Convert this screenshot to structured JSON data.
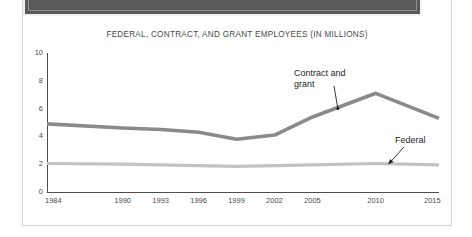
{
  "banner": {
    "name": "top-dark-banner",
    "color": "#5a5a5a"
  },
  "chart_data": {
    "type": "line",
    "title": "FEDERAL, CONTRACT, AND GRANT EMPLOYEES (IN MILLIONS)",
    "xlabel": "",
    "ylabel": "",
    "grid": false,
    "legend_position": "inline-annotation",
    "x": [
      1984,
      1990,
      1993,
      1996,
      1999,
      2002,
      2005,
      2010,
      2015
    ],
    "categories": [
      "1984",
      "1990",
      "1993",
      "1996",
      "1999",
      "2002",
      "2005",
      "2010",
      "2015"
    ],
    "xlim": [
      1984,
      2015
    ],
    "ylim": [
      0,
      10
    ],
    "yticks": [
      0,
      2,
      4,
      6,
      8,
      10
    ],
    "ytick_labels": [
      "0",
      "2",
      "4",
      "6",
      "8",
      "10"
    ],
    "series": [
      {
        "name": "Contract and grant",
        "label": "Contract and grant",
        "color": "#8a8a8a",
        "values": [
          4.9,
          4.6,
          4.5,
          4.3,
          3.8,
          4.1,
          5.4,
          7.1,
          5.3
        ]
      },
      {
        "name": "Federal",
        "label": "Federal",
        "color": "#c2c2c2",
        "values": [
          2.05,
          2.0,
          1.95,
          1.9,
          1.85,
          1.9,
          1.95,
          2.05,
          1.95
        ]
      }
    ],
    "annotations": [
      {
        "name": "contract-and-grant-annotation",
        "text_line1": "Contract and",
        "text_line2": "grant",
        "points_to_x": 2007,
        "points_to_y": 6.0
      },
      {
        "name": "federal-annotation",
        "text_line1": "Federal",
        "text_line2": "",
        "points_to_x": 2011,
        "points_to_y": 2.0
      }
    ]
  }
}
